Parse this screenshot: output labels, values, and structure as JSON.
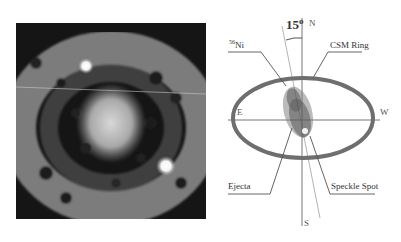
{
  "figure": {
    "left_panel": {
      "description": "grayscale astronomical image showing ring structure with central diffuse source and two bright point sources"
    },
    "right_panel": {
      "angle_label": "15",
      "angle_unit": "o",
      "compass": {
        "north": "N",
        "south": "S",
        "east": "E",
        "west": "W"
      },
      "labels": {
        "ni": "56Ni",
        "ni_mass": "56",
        "ni_element": "Ni",
        "csm_ring": "CSM Ring",
        "ejecta": "Ejecta",
        "speckle_spot": "Speckle Spot"
      },
      "colors": {
        "ring": "#6e6e6e",
        "lines": "#777777",
        "cloud": "#555555"
      }
    }
  }
}
